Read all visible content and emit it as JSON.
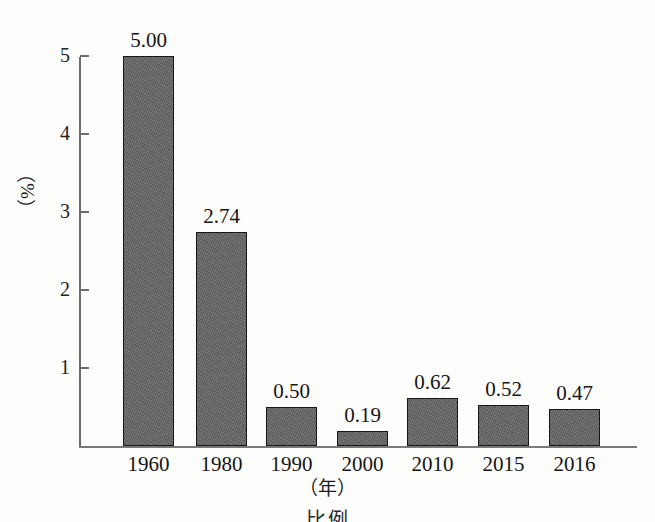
{
  "chart_data": {
    "type": "bar",
    "title": "",
    "subtitle": "",
    "xlabel": "（年）",
    "ylabel": "（%）",
    "categories": [
      "1960",
      "1980",
      "1990",
      "2000",
      "2010",
      "2015",
      "2016"
    ],
    "values": [
      5.0,
      2.74,
      0.5,
      0.19,
      0.62,
      0.52,
      0.47
    ],
    "value_labels": [
      "5.00",
      "2.74",
      "0.50",
      "0.19",
      "0.62",
      "0.52",
      "0.47"
    ],
    "ylim": [
      0,
      5
    ],
    "y_ticks": [
      1,
      2,
      3,
      4,
      5
    ],
    "y_tick_labels": [
      "1",
      "2",
      "3",
      "4",
      "5"
    ],
    "grid": false,
    "legend": null,
    "series": [
      {
        "name": "",
        "values": [
          5.0,
          2.74,
          0.5,
          0.19,
          0.62,
          0.52,
          0.47
        ]
      }
    ],
    "bar_color": "#656565",
    "bar_edge_color": "#171717",
    "axis_color": "#6d6d6d"
  },
  "caption": {
    "text": "比例"
  }
}
